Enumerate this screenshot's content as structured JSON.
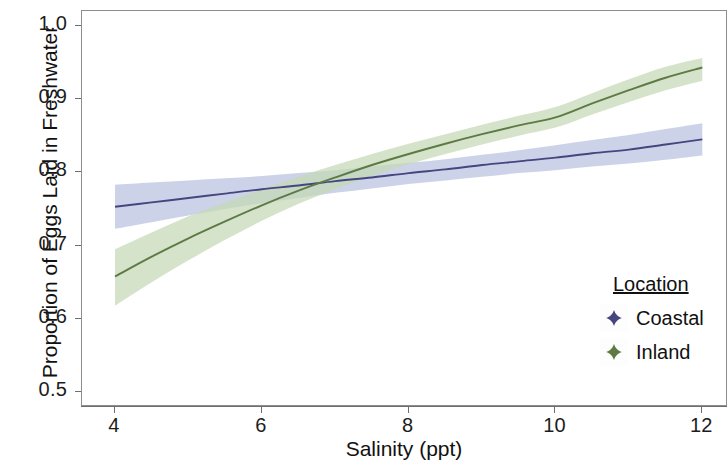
{
  "chart_data": {
    "type": "line",
    "title": "",
    "xlabel": "Salinity (ppt)",
    "ylabel": "Proportion of Eggs Laid in Freshwater",
    "xlim": [
      3.55,
      12.35
    ],
    "ylim": [
      0.48,
      1.02
    ],
    "xticks": [
      4,
      6,
      8,
      10,
      12
    ],
    "xtick_labels": [
      "4",
      "6",
      "8",
      "10",
      "12"
    ],
    "yticks": [
      0.5,
      0.6,
      0.7,
      0.8,
      0.9,
      1.0
    ],
    "ytick_labels": [
      "0.5",
      "0.6",
      "0.7",
      "0.8",
      "0.9",
      "1.0"
    ],
    "grid": false,
    "legend_position": "right",
    "legend_title": "Location",
    "bands": "95% confidence ribbons shown around each fitted line",
    "series": [
      {
        "name": "Coastal",
        "color": "#45457f",
        "ribbon_color": "#b9c2e0",
        "x": [
          4.0,
          4.5,
          5.0,
          5.5,
          6.0,
          6.5,
          7.0,
          7.5,
          8.0,
          8.5,
          9.0,
          9.5,
          10.0,
          10.5,
          11.0,
          11.5,
          12.0
        ],
        "y": [
          0.753,
          0.759,
          0.765,
          0.771,
          0.777,
          0.782,
          0.788,
          0.793,
          0.799,
          0.804,
          0.81,
          0.815,
          0.82,
          0.826,
          0.831,
          0.838,
          0.845
        ],
        "ylower": [
          0.723,
          0.732,
          0.741,
          0.75,
          0.758,
          0.765,
          0.772,
          0.778,
          0.784,
          0.789,
          0.794,
          0.799,
          0.803,
          0.808,
          0.812,
          0.817,
          0.823
        ],
        "yupper": [
          0.783,
          0.786,
          0.789,
          0.792,
          0.795,
          0.799,
          0.803,
          0.808,
          0.813,
          0.818,
          0.824,
          0.83,
          0.837,
          0.844,
          0.851,
          0.859,
          0.867
        ]
      },
      {
        "name": "Inland",
        "color": "#5d7a45",
        "ribbon_color": "#c3d8b4",
        "x": [
          4.0,
          4.5,
          5.0,
          5.5,
          6.0,
          6.5,
          7.0,
          7.5,
          8.0,
          8.5,
          9.0,
          9.5,
          10.0,
          10.5,
          11.0,
          11.5,
          12.0
        ],
        "y": [
          0.658,
          0.685,
          0.71,
          0.733,
          0.755,
          0.775,
          0.793,
          0.81,
          0.825,
          0.839,
          0.852,
          0.864,
          0.875,
          0.894,
          0.912,
          0.929,
          0.943
        ],
        "ylower": [
          0.618,
          0.65,
          0.68,
          0.708,
          0.734,
          0.757,
          0.777,
          0.795,
          0.811,
          0.825,
          0.838,
          0.85,
          0.861,
          0.879,
          0.896,
          0.912,
          0.925
        ],
        "yupper": [
          0.695,
          0.718,
          0.74,
          0.759,
          0.777,
          0.794,
          0.81,
          0.825,
          0.839,
          0.852,
          0.865,
          0.877,
          0.889,
          0.908,
          0.927,
          0.944,
          0.956
        ]
      }
    ],
    "crossing_point": {
      "x": 6.9,
      "y": 0.79
    }
  },
  "legend": {
    "title": "Location",
    "entries": [
      {
        "label": "Coastal",
        "color": "#45457f"
      },
      {
        "label": "Inland",
        "color": "#5d7a45"
      }
    ]
  }
}
